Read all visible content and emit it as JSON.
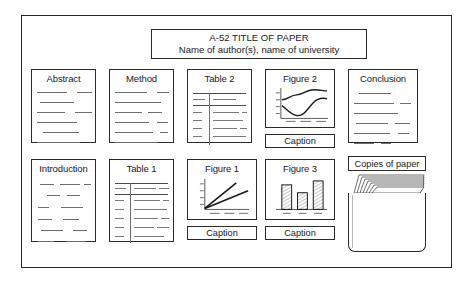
{
  "diagram": {
    "kind": "poster-layout-template",
    "board": {
      "label": "poster-board"
    },
    "title_banner": {
      "line1": "A-52 TITLE OF PAPER",
      "line2": "Name of author(s), name of university"
    },
    "panels": [
      {
        "id": "abstract",
        "label": "Abstract",
        "content": "text-lines"
      },
      {
        "id": "method",
        "label": "Method",
        "content": "text-lines"
      },
      {
        "id": "table2",
        "label": "Table 2",
        "content": "table"
      },
      {
        "id": "figure2",
        "label": "Figure 2",
        "content": "line-chart-curves"
      },
      {
        "id": "conclusion",
        "label": "Conclusion",
        "content": "text-lines"
      },
      {
        "id": "introduction",
        "label": "Introduction",
        "content": "text-lines"
      },
      {
        "id": "table1",
        "label": "Table 1",
        "content": "table"
      },
      {
        "id": "figure1",
        "label": "Figure 1",
        "content": "line-chart-rays"
      },
      {
        "id": "figure3",
        "label": "Figure 3",
        "content": "bar-chart"
      }
    ],
    "captions": [
      {
        "id": "caption-figure2",
        "label": "Caption"
      },
      {
        "id": "caption-figure1",
        "label": "Caption"
      },
      {
        "id": "caption-figure3",
        "label": "Caption"
      }
    ],
    "copies_pocket": {
      "label": "Copies of paper",
      "sheet_count": 7
    },
    "colors": {
      "ink": "#2b2b2b",
      "rule": "#6e6e6e",
      "paper": "#ffffff"
    }
  }
}
